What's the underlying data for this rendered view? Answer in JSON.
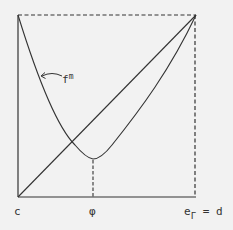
{
  "diagram": {
    "background": "#f2f2f2",
    "line_color": "#333333",
    "frame": {
      "left": 18,
      "top": 15,
      "right": 196,
      "bottom": 197
    },
    "curve_label": {
      "base": "f",
      "superscript": "m"
    },
    "axis_labels": {
      "left": "c",
      "middle": "φ",
      "right_base": "e",
      "right_subscript": "Γ",
      "right_suffix": "= d"
    },
    "elements": [
      "solid left edge of square",
      "solid bottom edge of square",
      "dashed top edge of square",
      "dashed right edge of square",
      "diagonal line from (c, bottom) to top-right corner",
      "convex curve f^m from top-left corner down to minimum at φ, then up to top-right corner",
      "dashed vertical line from curve minimum down to φ on the baseline",
      "curved arrow pointing from label f^m to the curve"
    ]
  }
}
